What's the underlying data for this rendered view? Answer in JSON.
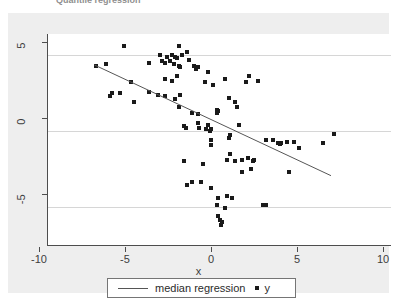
{
  "caption": {
    "text": "Quantile regression"
  },
  "axes": {
    "x_title": "x",
    "x_ticks": [
      "-10",
      "-5",
      "0",
      "5",
      "10"
    ],
    "x_tick_values": [
      -10,
      -5,
      0,
      5,
      10
    ],
    "y_ticks": [
      "5",
      "0",
      "-5"
    ],
    "y_tick_values": [
      5,
      0,
      -5
    ]
  },
  "legend": {
    "line_label": "median regression",
    "marker_label": "y"
  },
  "colors": {
    "marker": "#1a1a1a",
    "line": "#555555",
    "gridline": "#d6d6d6",
    "axis": "#4d4d4d",
    "graph_background": "#eeeeee",
    "plot_background": "#ffffff"
  },
  "chart_data": {
    "type": "scatter",
    "title": "",
    "xlabel": "x",
    "ylabel": "",
    "xlim": [
      -10,
      10
    ],
    "ylim": [
      -7.6,
      6.4
    ],
    "grid": true,
    "legend_position": "bottom",
    "series": [
      {
        "name": "y",
        "type": "scatter",
        "marker": "square",
        "points": [
          [
            -5.6,
            5.6
          ],
          [
            -2.4,
            5.6
          ],
          [
            -1.9,
            5.2
          ],
          [
            -3.5,
            5.0
          ],
          [
            -3.1,
            4.9
          ],
          [
            -2.8,
            5.0
          ],
          [
            -2.6,
            4.9
          ],
          [
            -2.5,
            4.8
          ],
          [
            -2.2,
            5.0
          ],
          [
            -1.8,
            4.7
          ],
          [
            -2.9,
            4.6
          ],
          [
            -3.2,
            4.5
          ],
          [
            -3.4,
            4.6
          ],
          [
            -4.1,
            4.5
          ],
          [
            -2.7,
            4.4
          ],
          [
            -2.4,
            4.3
          ],
          [
            -7.2,
            4.3
          ],
          [
            -6.6,
            4.4
          ],
          [
            -2.3,
            4.2
          ],
          [
            -1.5,
            4.3
          ],
          [
            -1.4,
            4.1
          ],
          [
            -1.3,
            4.2
          ],
          [
            -0.7,
            3.9
          ],
          [
            -2.5,
            3.6
          ],
          [
            -3.2,
            3.4
          ],
          [
            -2.8,
            3.3
          ],
          [
            -0.9,
            3.2
          ],
          [
            0.3,
            3.4
          ],
          [
            1.7,
            3.6
          ],
          [
            2.2,
            3.3
          ],
          [
            1.5,
            3.2
          ],
          [
            -0.4,
            3.0
          ],
          [
            -5.2,
            3.2
          ],
          [
            -6.3,
            2.5
          ],
          [
            -6.4,
            2.3
          ],
          [
            -5.8,
            2.5
          ],
          [
            -4.1,
            2.6
          ],
          [
            -3.6,
            2.4
          ],
          [
            -3.2,
            2.3
          ],
          [
            -2.3,
            2.4
          ],
          [
            -2.6,
            2.1
          ],
          [
            -5.0,
            1.9
          ],
          [
            -2.4,
            1.6
          ],
          [
            0.5,
            2.2
          ],
          [
            0.9,
            1.9
          ],
          [
            1.0,
            1.6
          ],
          [
            -1.6,
            1.2
          ],
          [
            -1.3,
            1.1
          ],
          [
            -0.2,
            1.4
          ],
          [
            -0.1,
            1.3
          ],
          [
            -0.15,
            1.2
          ],
          [
            -2.1,
            0.3
          ],
          [
            -2.0,
            0.2
          ],
          [
            -1.3,
            0.5
          ],
          [
            -1.2,
            0.2
          ],
          [
            -0.8,
            0.1
          ],
          [
            -0.7,
            0.4
          ],
          [
            -0.6,
            0.0
          ],
          [
            -0.5,
            0.1
          ],
          [
            1.1,
            0.4
          ],
          [
            0.6,
            -0.3
          ],
          [
            0.5,
            -0.5
          ],
          [
            -0.55,
            -0.6
          ],
          [
            -0.5,
            -0.9
          ],
          [
            2.7,
            -0.6
          ],
          [
            3.1,
            -0.6
          ],
          [
            3.4,
            -0.8
          ],
          [
            3.5,
            -0.85
          ],
          [
            3.55,
            -0.8
          ],
          [
            3.9,
            -0.7
          ],
          [
            4.3,
            -0.7
          ],
          [
            6.0,
            -0.8
          ],
          [
            6.6,
            -0.2
          ],
          [
            4.6,
            -1.1
          ],
          [
            0.6,
            -1.5
          ],
          [
            0.4,
            -1.9
          ],
          [
            0.9,
            -2.0
          ],
          [
            1.3,
            -1.9
          ],
          [
            1.6,
            -1.8
          ],
          [
            1.9,
            -2.0
          ],
          [
            2.0,
            -1.9
          ],
          [
            1.8,
            -2.5
          ],
          [
            1.3,
            -2.7
          ],
          [
            -2.1,
            -2.0
          ],
          [
            -1.0,
            -2.2
          ],
          [
            4.0,
            -2.7
          ],
          [
            -1.6,
            -3.4
          ],
          [
            -1.9,
            -3.6
          ],
          [
            -1.1,
            -3.4
          ],
          [
            -0.5,
            -3.8
          ],
          [
            -0.1,
            -4.4
          ],
          [
            0.4,
            -4.3
          ],
          [
            0.7,
            -4.4
          ],
          [
            -0.2,
            -4.9
          ],
          [
            0.3,
            -5.1
          ],
          [
            -0.1,
            -5.6
          ],
          [
            0.0,
            -5.9
          ],
          [
            0.1,
            -6.0
          ],
          [
            0.05,
            -6.2
          ],
          [
            2.5,
            -4.9
          ],
          [
            2.7,
            -4.9
          ]
        ]
      },
      {
        "name": "median regression",
        "type": "line",
        "points": [
          [
            -7.3,
            4.35
          ],
          [
            6.5,
            -3.0
          ]
        ]
      }
    ]
  }
}
